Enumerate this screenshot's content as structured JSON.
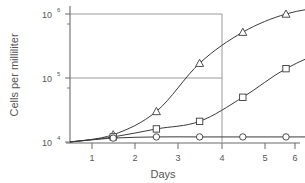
{
  "chart_data": {
    "type": "line",
    "title": "",
    "xlabel": "Days",
    "ylabel": "Cells per milliliter",
    "yscale": "log",
    "xlim": [
      0,
      7.4
    ],
    "ylim": [
      10000,
      2000000
    ],
    "grid": false,
    "legend": "none",
    "x": [
      1,
      2,
      3,
      4,
      5,
      6,
      7
    ],
    "ytick_labels": [
      "10",
      "10",
      "10"
    ],
    "ytick_exponents": [
      "6",
      "5",
      "4"
    ],
    "ytick_values": [
      1000000,
      100000,
      10000
    ],
    "xtick_labels": [
      "1",
      "2",
      "3",
      "4",
      "5",
      "6",
      "7"
    ],
    "series": [
      {
        "name": "triangle-series",
        "marker": "triangle",
        "values": [
          13000,
          30000,
          170000,
          520000,
          1000000,
          1300000,
          1400000
        ]
      },
      {
        "name": "square-series",
        "marker": "square",
        "values": [
          12000,
          16000,
          21000,
          50000,
          140000,
          270000,
          340000
        ]
      },
      {
        "name": "circle-series",
        "marker": "circle",
        "values": [
          11500,
          12000,
          12000,
          12000,
          12000,
          12000,
          12000
        ]
      }
    ],
    "reference_lines": [
      {
        "name": "hline-upper",
        "orientation": "horizontal",
        "value": 1000000
      },
      {
        "name": "hline-lower",
        "orientation": "horizontal",
        "value": 140000
      },
      {
        "name": "vline-day5",
        "orientation": "vertical",
        "value": 5
      }
    ],
    "colors": {
      "curve": "#3a3a3a",
      "axis": "#6b6b6b",
      "reference": "#9a9a9a",
      "marker_fill": "#ffffff",
      "text": "#555555",
      "background": "#ffffff"
    }
  }
}
